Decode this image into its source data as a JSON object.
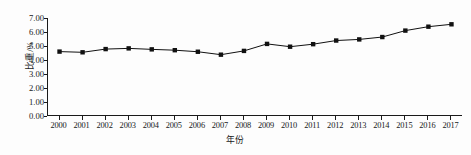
{
  "chart_data": {
    "type": "line",
    "title": "",
    "xlabel": "年份",
    "ylabel": "比重/%",
    "x": [
      2000,
      2001,
      2002,
      2003,
      2004,
      2005,
      2006,
      2007,
      2008,
      2009,
      2010,
      2011,
      2012,
      2013,
      2014,
      2015,
      2016,
      2017
    ],
    "categories": [
      "2000",
      "2001",
      "2002",
      "2003",
      "2004",
      "2005",
      "2006",
      "2007",
      "2008",
      "2009",
      "2010",
      "2011",
      "2012",
      "2013",
      "2014",
      "2015",
      "2016",
      "2017"
    ],
    "values": [
      4.6,
      4.55,
      4.78,
      4.83,
      4.76,
      4.7,
      4.59,
      4.38,
      4.65,
      5.15,
      4.95,
      5.13,
      5.39,
      5.47,
      5.64,
      6.1,
      6.38,
      6.55
    ],
    "series": [
      {
        "name": "比重",
        "values": [
          4.6,
          4.55,
          4.78,
          4.83,
          4.76,
          4.7,
          4.59,
          4.38,
          4.65,
          5.15,
          4.95,
          5.13,
          5.39,
          5.47,
          5.64,
          6.1,
          6.38,
          6.55
        ],
        "marker": "square",
        "color": "#111111"
      }
    ],
    "ylim": [
      0.0,
      7.0
    ],
    "yticks": [
      0.0,
      1.0,
      2.0,
      3.0,
      4.0,
      5.0,
      6.0,
      7.0
    ],
    "ytick_labels": [
      "0.00",
      "1.00",
      "2.00",
      "3.00",
      "4.00",
      "5.00",
      "6.00",
      "7.00"
    ],
    "grid": false,
    "legend": false,
    "legend_position": "none",
    "line_color": "#111111",
    "marker_color": "#111111",
    "axis_color": "#1a1a1a",
    "background_color": "#ffffff"
  }
}
